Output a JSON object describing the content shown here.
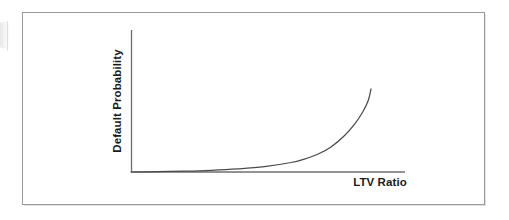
{
  "figure": {
    "background_color": "#ffffff",
    "border_color": "#9a9a9a",
    "artifact_name": "page-scan-edge"
  },
  "chart_data": {
    "type": "line",
    "title": "",
    "subtitle": "",
    "xlabel": "LTV Ratio",
    "ylabel": "Default Probability",
    "annotations": [],
    "legend": [],
    "legend_position": "none",
    "grid": false,
    "xticks": [],
    "yticks": [],
    "xtick_labels": [],
    "ytick_labels": [],
    "xlim": [
      0,
      1
    ],
    "ylim": [
      0,
      1
    ],
    "line_color": "#4a4a4a",
    "axis_color": "#6e6e6e",
    "series": [
      {
        "name": "Default probability vs LTV",
        "x": [
          0.0,
          0.1,
          0.2,
          0.3,
          0.4,
          0.5,
          0.6,
          0.65,
          0.7,
          0.75,
          0.8,
          0.84,
          0.87,
          0.89,
          0.9
        ],
        "y": [
          0.0,
          0.004,
          0.01,
          0.02,
          0.036,
          0.062,
          0.11,
          0.15,
          0.205,
          0.29,
          0.42,
          0.56,
          0.7,
          0.83,
          0.96
        ]
      }
    ]
  },
  "axes_geometry": {
    "y_axis_x": 131,
    "y_axis_top": 30,
    "x_axis_y": 172,
    "x_axis_right": 405,
    "curve_top_x": 371,
    "curve_top_y": 89
  }
}
